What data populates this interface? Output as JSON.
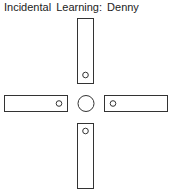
{
  "title": "Incidental  Learning:  Denny",
  "colors": {
    "stroke": "#333333",
    "background": "#ffffff"
  },
  "diagram": {
    "arms": [
      {
        "name": "top-arm",
        "x": 77.5,
        "y": 18.5,
        "w": 16,
        "h": 65,
        "hole": {
          "cx": 85.5,
          "cy": 75
        }
      },
      {
        "name": "left-arm",
        "x": 4.5,
        "y": 95.5,
        "w": 63,
        "h": 16,
        "hole": {
          "cx": 59,
          "cy": 103.5
        }
      },
      {
        "name": "right-arm",
        "x": 104.5,
        "y": 95.5,
        "w": 63,
        "h": 16,
        "hole": {
          "cx": 113,
          "cy": 103.5
        }
      },
      {
        "name": "bottom-arm",
        "x": 77.5,
        "y": 123.5,
        "w": 16,
        "h": 65,
        "hole": {
          "cx": 85.5,
          "cy": 131
        }
      }
    ],
    "center": {
      "cx": 86,
      "cy": 103.5,
      "r": 8
    },
    "hole_radius": 2.8
  }
}
